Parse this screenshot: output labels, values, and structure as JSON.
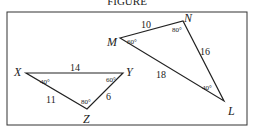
{
  "header": {
    "title_partial": "FIGURE"
  },
  "figure": {
    "triangles": [
      {
        "name": "XYZ",
        "vertices": [
          {
            "label": "X",
            "angle": "40°"
          },
          {
            "label": "Y",
            "angle": "60°"
          },
          {
            "label": "Z",
            "angle": "80°"
          }
        ],
        "sides": [
          {
            "between": "XY",
            "length": "14"
          },
          {
            "between": "XZ",
            "length": "11"
          },
          {
            "between": "YZ",
            "length": "6"
          }
        ]
      },
      {
        "name": "MNL",
        "vertices": [
          {
            "label": "M",
            "angle": "60°"
          },
          {
            "label": "N",
            "angle": "80°"
          },
          {
            "label": "L",
            "angle": "40°"
          }
        ],
        "sides": [
          {
            "between": "MN",
            "length": "10"
          },
          {
            "between": "NL",
            "length": "16"
          },
          {
            "between": "ML",
            "length": "18"
          }
        ]
      }
    ]
  }
}
